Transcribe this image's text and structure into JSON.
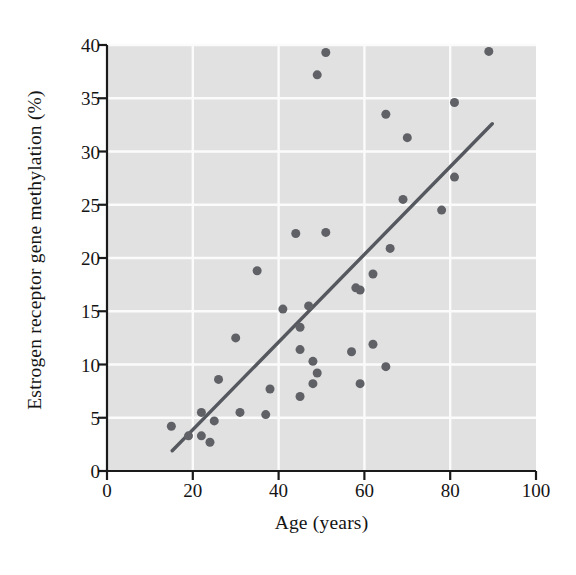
{
  "chart_data": {
    "type": "scatter",
    "title": "",
    "xlabel": "Age (years)",
    "ylabel": "Estrogen receptor gene methylation (%)",
    "xlim": [
      0,
      100
    ],
    "ylim": [
      0,
      40
    ],
    "xticks": [
      0,
      20,
      40,
      60,
      80,
      100
    ],
    "yticks": [
      0,
      5,
      10,
      15,
      20,
      25,
      30,
      35,
      40
    ],
    "xtick_labels": [
      "0",
      "20",
      "40",
      "60",
      "80",
      "100"
    ],
    "ytick_labels": [
      "0",
      "5",
      "10",
      "15",
      "20",
      "25",
      "30",
      "35",
      "40"
    ],
    "grid": true,
    "grid_color": "#fbfbfb",
    "plot_background": "#e4e4e4",
    "marker_color": "#5f6166",
    "marker_size": 9,
    "legend": null,
    "points": [
      {
        "x": 15,
        "y": 4.2
      },
      {
        "x": 19,
        "y": 3.3
      },
      {
        "x": 22,
        "y": 5.5
      },
      {
        "x": 22,
        "y": 3.3
      },
      {
        "x": 24,
        "y": 2.7
      },
      {
        "x": 25,
        "y": 4.7
      },
      {
        "x": 26,
        "y": 8.6
      },
      {
        "x": 30,
        "y": 12.5
      },
      {
        "x": 31,
        "y": 5.5
      },
      {
        "x": 35,
        "y": 18.8
      },
      {
        "x": 37,
        "y": 5.3
      },
      {
        "x": 38,
        "y": 7.7
      },
      {
        "x": 41,
        "y": 15.2
      },
      {
        "x": 44,
        "y": 22.3
      },
      {
        "x": 45,
        "y": 7.0
      },
      {
        "x": 45,
        "y": 11.4
      },
      {
        "x": 45,
        "y": 13.5
      },
      {
        "x": 47,
        "y": 15.5
      },
      {
        "x": 48,
        "y": 8.2
      },
      {
        "x": 48,
        "y": 10.3
      },
      {
        "x": 49,
        "y": 9.2
      },
      {
        "x": 49,
        "y": 37.2
      },
      {
        "x": 51,
        "y": 39.3
      },
      {
        "x": 51,
        "y": 22.4
      },
      {
        "x": 57,
        "y": 11.2
      },
      {
        "x": 58,
        "y": 17.2
      },
      {
        "x": 59,
        "y": 17.0
      },
      {
        "x": 59,
        "y": 8.2
      },
      {
        "x": 62,
        "y": 18.5
      },
      {
        "x": 62,
        "y": 11.9
      },
      {
        "x": 65,
        "y": 33.5
      },
      {
        "x": 65,
        "y": 9.8
      },
      {
        "x": 66,
        "y": 20.9
      },
      {
        "x": 69,
        "y": 25.5
      },
      {
        "x": 70,
        "y": 31.3
      },
      {
        "x": 78,
        "y": 24.5
      },
      {
        "x": 81,
        "y": 34.6
      },
      {
        "x": 81,
        "y": 27.6
      },
      {
        "x": 89,
        "y": 39.4
      }
    ],
    "trend_line": {
      "type": "linear-fit",
      "color": "#55585e",
      "width": 3.4,
      "x_start": 15.2,
      "y_start": 1.9,
      "x_end": 89.8,
      "y_end": 32.6
    }
  }
}
